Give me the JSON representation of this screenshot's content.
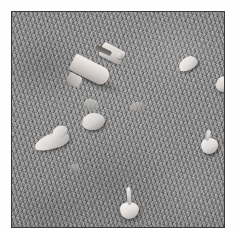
{
  "image": {
    "kind": "photograph",
    "subject": "scattered pale objects on grass",
    "color_mode": "grayscale",
    "orientation": "portrait",
    "frame": {
      "background_color": "#ffffff",
      "border_color": "#3a3a3a",
      "border_width_px": 1,
      "margin_left_px": 11,
      "margin_top_px": 11,
      "photo_width_px": 214,
      "photo_height_px": 217
    },
    "ground": {
      "label": "grass-ground",
      "base_color": "#8a8a8a",
      "texture": "fine grainy turf",
      "tone_range": [
        "#5a5a5a",
        "#b4b4b4"
      ]
    },
    "objects": [
      {
        "id": "whistle",
        "label": "whistle-object",
        "description": "large pale funnel or whistle shaped object",
        "x": 55,
        "y": 32,
        "width": 58,
        "height": 46,
        "highlight_color": "#f2f0ec",
        "shadow_color": "#8b8784"
      },
      {
        "id": "bulb-top-right-a",
        "label": "pale-bulb",
        "description": "small white bulb near upper right",
        "x": 166,
        "y": 45,
        "width": 18,
        "height": 12,
        "highlight_color": "#f4f2ef"
      },
      {
        "id": "bulb-top-right-b",
        "label": "pale-bulb",
        "description": "small white bulb at far right edge",
        "x": 204,
        "y": 65,
        "width": 14,
        "height": 14,
        "highlight_color": "#ebe8e5"
      },
      {
        "id": "bulb-right-mid",
        "label": "pale-bulb",
        "description": "bulb with stem at mid right",
        "x": 188,
        "y": 118,
        "width": 16,
        "height": 22,
        "highlight_color": "#f2efec"
      },
      {
        "id": "bulb-left-mid",
        "label": "pale-debris",
        "description": "elongated irregular white fragment at left",
        "x": 22,
        "y": 120,
        "width": 34,
        "height": 18,
        "highlight_color": "#efeceb"
      },
      {
        "id": "bulb-center",
        "label": "pale-bulb",
        "description": "clustered white fragment near centre",
        "x": 70,
        "y": 100,
        "width": 22,
        "height": 18,
        "highlight_color": "#eeeae7"
      },
      {
        "id": "debris-center-upper",
        "label": "pale-debris",
        "description": "faint small fragment above centre cluster",
        "x": 72,
        "y": 88,
        "width": 14,
        "height": 10,
        "highlight_color": "#b8b4b1"
      },
      {
        "id": "debris-center-right",
        "label": "pale-debris",
        "description": "faint fragment right of centre",
        "x": 118,
        "y": 90,
        "width": 14,
        "height": 9,
        "highlight_color": "#b2aeab"
      },
      {
        "id": "bulb-bottom-center",
        "label": "pale-bulb",
        "description": "bulb with long stem near bottom centre",
        "x": 108,
        "y": 178,
        "width": 18,
        "height": 28,
        "highlight_color": "#f6f4f1"
      },
      {
        "id": "debris-lower-left",
        "label": "pale-debris",
        "description": "faint small speck lower left",
        "x": 58,
        "y": 152,
        "width": 9,
        "height": 8,
        "highlight_color": "#a8a4a1"
      }
    ]
  }
}
